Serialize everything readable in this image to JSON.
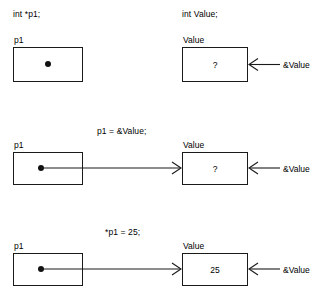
{
  "figure": {
    "stroke_color": "#1a1a1a",
    "dot_color": "#111111",
    "background": "#ffffff"
  },
  "rows": [
    {
      "id": "declaration",
      "pointer_statement": "int *p1;",
      "value_statement": "int Value;",
      "pointer_label": "p1",
      "pointer_cell": "",
      "value_label": "Value",
      "value_cell": "?",
      "address_label": "&Value",
      "has_link": false
    },
    {
      "id": "assign-address",
      "statement": "p1 = &Value;",
      "pointer_label": "p1",
      "pointer_cell": "",
      "value_label": "Value",
      "value_cell": "?",
      "address_label": "&Value",
      "has_link": true
    },
    {
      "id": "dereference-assign",
      "statement": "*p1 = 25;",
      "pointer_label": "p1",
      "pointer_cell": "",
      "value_label": "Value",
      "value_cell": "25",
      "address_label": "&Value",
      "has_link": true
    }
  ]
}
